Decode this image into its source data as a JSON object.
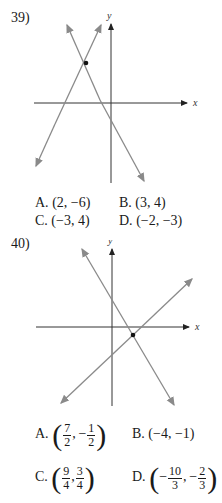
{
  "problems": [
    {
      "number": "39)",
      "axis_labels": {
        "x": "x",
        "y": "y"
      },
      "options": [
        {
          "label": "A.",
          "value": "(2, −6)"
        },
        {
          "label": "B.",
          "value": "(3, 4)"
        },
        {
          "label": "C.",
          "value": "(−3, 4)"
        },
        {
          "label": "D.",
          "value": "(−2, −3)"
        }
      ]
    },
    {
      "number": "40)",
      "axis_labels": {
        "x": "x",
        "y": "y"
      },
      "options": [
        {
          "label": "A.",
          "value": "(7/2, −1/2)",
          "x_num": "7",
          "x_den": "2",
          "x_sign": "",
          "y_num": "1",
          "y_den": "2",
          "y_sign": "−"
        },
        {
          "label": "B.",
          "value": "(−4, −1)"
        },
        {
          "label": "C.",
          "value": "(9/4, 3/4)",
          "x_num": "9",
          "x_den": "4",
          "x_sign": "",
          "y_num": "3",
          "y_den": "4",
          "y_sign": ""
        },
        {
          "label": "D.",
          "value": "(−10/3, −2/3)",
          "x_num": "10",
          "x_den": "3",
          "x_sign": "−",
          "y_num": "2",
          "y_den": "3",
          "y_sign": "−"
        }
      ]
    }
  ],
  "colors": {
    "line": "#8a8a8a",
    "axis": "#333333",
    "point": "#111111"
  }
}
